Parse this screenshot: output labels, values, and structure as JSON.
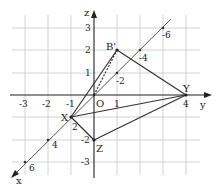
{
  "diagram": {
    "axes": {
      "y_label": "y",
      "z_label": "z",
      "x_label": "x",
      "origin_label": "O"
    },
    "y_ticks": [
      "-3",
      "-2",
      "-1",
      "1",
      "4"
    ],
    "z_ticks": [
      "3",
      "2",
      "1",
      "-2",
      "-3"
    ],
    "x_ticks": [
      "-2",
      "-4",
      "-6",
      "2",
      "4",
      "6"
    ],
    "points": {
      "X": "X",
      "Y": "Y",
      "Z": "Z",
      "B": "B'"
    },
    "colors": {
      "grid": "#c8c8c8",
      "lines": "#333333",
      "axis": "#222222"
    }
  }
}
